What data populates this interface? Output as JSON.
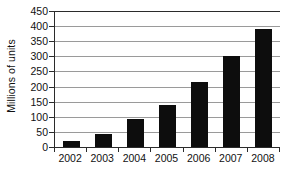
{
  "chart_data": {
    "type": "bar",
    "title": "",
    "subtitle": "",
    "xlabel": "",
    "ylabel": "Millions of units",
    "categories": [
      "2002",
      "2003",
      "2004",
      "2005",
      "2006",
      "2007",
      "2008"
    ],
    "values": [
      20,
      42,
      93,
      140,
      215,
      302,
      392
    ],
    "ylim": [
      0,
      450
    ],
    "ytick_values": [
      0,
      50,
      100,
      150,
      200,
      250,
      300,
      350,
      400,
      450
    ],
    "ytick_labels": [
      "0",
      "50",
      "100",
      "150",
      "200",
      "250",
      "300",
      "350",
      "400",
      "450"
    ],
    "grid": true,
    "grid_axis": "y",
    "legend": false,
    "legend_position": "none",
    "annotations": [],
    "series": [
      {
        "name": "Millions of units",
        "values": [
          20,
          42,
          93,
          140,
          215,
          302,
          392
        ]
      }
    ],
    "colors": {
      "bar": "#0d0d0d",
      "gridline": "#9a9a9a",
      "axis": "#2b2b2b",
      "background": "#ffffff",
      "text": "#111111"
    }
  }
}
